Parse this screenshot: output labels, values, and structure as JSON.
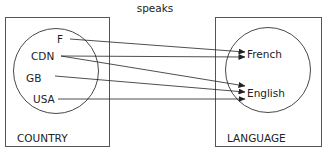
{
  "title": "speaks",
  "sets": {
    "country": {
      "caption": "COUNTRY",
      "elements": [
        "F",
        "CDN",
        "GB",
        "USA"
      ]
    },
    "language": {
      "caption": "LANGUAGE",
      "elements": [
        "French",
        "English"
      ]
    }
  },
  "relation": [
    {
      "from": "F",
      "to": "French"
    },
    {
      "from": "CDN",
      "to": "French"
    },
    {
      "from": "CDN",
      "to": "English"
    },
    {
      "from": "GB",
      "to": "English"
    },
    {
      "from": "USA",
      "to": "English"
    }
  ],
  "colors": {
    "stroke": "#333333",
    "box": "#555555",
    "text": "#222222"
  }
}
